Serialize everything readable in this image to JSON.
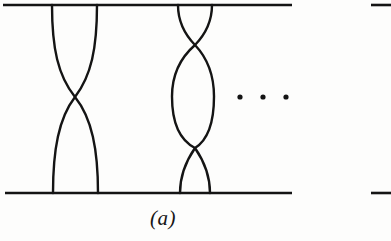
{
  "figure": {
    "caption": "(a)",
    "stroke_color": "#141414",
    "background_color": "#fdfdfc",
    "width": 391,
    "height": 241
  },
  "diagram_data": {
    "type": "braid-diagram",
    "description": "Braid / tangle diagram with two strand bundles between a top and a bottom horizontal bar, separated by a horizontal ellipsis.",
    "top_bar": {
      "x1": 3,
      "x2": 292,
      "y": 5
    },
    "bottom_bar": {
      "x1": 5,
      "x2": 292,
      "y": 193
    },
    "edge_fragments": [
      {
        "x1": 371,
        "x2": 391,
        "y": 5
      },
      {
        "x1": 371,
        "x2": 391,
        "y": 193
      }
    ],
    "braids": [
      {
        "name": "left-braid",
        "crossings": 1,
        "top_anchors": [
          52,
          97
        ],
        "bottom_anchors": [
          53,
          98
        ],
        "crossing_points": [
          {
            "x": 75,
            "y": 97
          }
        ]
      },
      {
        "name": "right-braid",
        "crossings": 2,
        "top_anchors": [
          178,
          212
        ],
        "bottom_anchors": [
          180,
          210
        ],
        "crossing_points": [
          {
            "x": 195,
            "y": 45
          },
          {
            "x": 195,
            "y": 148
          }
        ],
        "lens_extent": {
          "left": 172,
          "right": 214,
          "top": 45,
          "bottom": 148
        }
      }
    ],
    "ellipsis": {
      "label": "horizontal-ellipsis",
      "dots": [
        {
          "x": 240,
          "y": 97
        },
        {
          "x": 263,
          "y": 97
        },
        {
          "x": 286,
          "y": 97
        }
      ],
      "radius": 2.6
    }
  }
}
